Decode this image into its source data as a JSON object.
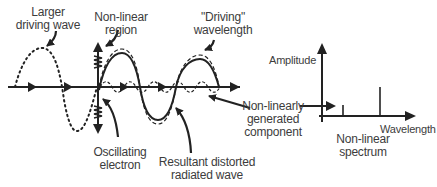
{
  "figure": {
    "labels": {
      "larger_driving_wave": [
        "Larger",
        "driving wave"
      ],
      "non_linear_region": [
        "Non-linear",
        "region"
      ],
      "driving_wavelength": [
        "\"Driving\"",
        "wavelength"
      ],
      "non_linearly_generated": [
        "Non-linearly",
        "generated",
        "component"
      ],
      "oscillating_electron": [
        "Oscillating",
        "electron"
      ],
      "resultant_wave": [
        "Resultant distorted",
        "radiated wave"
      ]
    },
    "spectrum": {
      "y_axis_label": "Amplitude",
      "x_axis_label": "Wavelength",
      "caption": [
        "Non-linear",
        "spectrum"
      ],
      "lines": [
        {
          "name": "non-linearly generated component",
          "relative_height": 0.25
        },
        {
          "name": "driving wavelength",
          "relative_height": 0.6
        }
      ]
    },
    "colors": {
      "stroke": "#222222",
      "text": "#3c3c3c",
      "background": "#ffffff"
    }
  }
}
